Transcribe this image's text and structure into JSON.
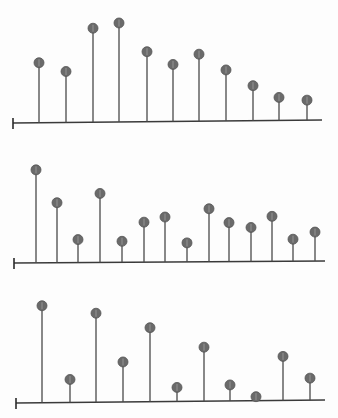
{
  "chart_data": [
    {
      "type": "stem",
      "title": "",
      "xlabel": "",
      "ylabel": "",
      "grid": false,
      "legend": null,
      "layout": {
        "axis_x_start": 13,
        "axis_x_end": 322,
        "baseline_y_left": 123,
        "baseline_y_right": 120
      },
      "x": [
        39,
        66,
        93,
        119,
        147,
        173,
        199,
        226,
        253,
        279,
        307
      ],
      "values": [
        60,
        51,
        94,
        99,
        70,
        57,
        67,
        51,
        35,
        23,
        20
      ],
      "ylim": [
        0,
        100
      ]
    },
    {
      "type": "stem",
      "title": "",
      "xlabel": "",
      "ylabel": "",
      "grid": false,
      "legend": null,
      "layout": {
        "axis_x_start": 14,
        "axis_x_end": 325,
        "baseline_y_left": 263,
        "baseline_y_right": 261
      },
      "x": [
        36,
        57,
        78,
        100,
        122,
        144,
        165,
        187,
        209,
        229,
        251,
        272,
        293,
        315
      ],
      "values": [
        93,
        60,
        23,
        69,
        21,
        40,
        45,
        19,
        53,
        39,
        34,
        45,
        22,
        29
      ],
      "ylim": [
        0,
        100
      ]
    },
    {
      "type": "stem",
      "title": "",
      "xlabel": "",
      "ylabel": "",
      "grid": false,
      "legend": null,
      "layout": {
        "axis_x_start": 16,
        "axis_x_end": 325,
        "baseline_y_left": 403,
        "baseline_y_right": 400
      },
      "x": [
        42,
        70,
        96,
        123,
        150,
        177,
        204,
        230,
        256,
        283,
        310
      ],
      "values": [
        97,
        23,
        89,
        40,
        74,
        14,
        54,
        16,
        4,
        44,
        22
      ],
      "ylim": [
        0,
        100
      ]
    }
  ],
  "style": {
    "stem_color": "#4a4a4a",
    "marker_color": "#6a6a6a",
    "axis_color": "#3a3a3a",
    "background": "#fdfdfd"
  }
}
